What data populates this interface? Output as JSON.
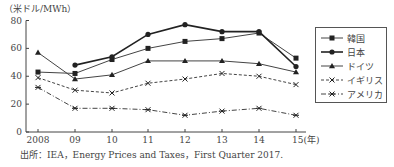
{
  "chart_data": {
    "type": "line",
    "title": "",
    "ylabel": "（米ドル/MWh）",
    "xlabel": "",
    "x": [
      "2008",
      "09",
      "10",
      "11",
      "12",
      "13",
      "14",
      "15(年)"
    ],
    "ylim": [
      0,
      80
    ],
    "yticks": [
      0,
      20,
      40,
      60,
      80
    ],
    "grid": false,
    "legend_position": "right",
    "series": [
      {
        "name": "韓国",
        "marker": "square",
        "line": "solid",
        "values": [
          43,
          42,
          52,
          60,
          65,
          67,
          71,
          53
        ]
      },
      {
        "name": "日本",
        "marker": "circle",
        "line": "solid-bold",
        "values": [
          null,
          48,
          54,
          70,
          77,
          72,
          72,
          47
        ]
      },
      {
        "name": "ドイツ",
        "marker": "triangle",
        "line": "solid",
        "values": [
          57,
          38,
          41,
          51,
          51,
          51,
          49,
          43
        ]
      },
      {
        "name": "イギリス",
        "marker": "x",
        "line": "dashed",
        "values": [
          39,
          30,
          28,
          35,
          38,
          42,
          40,
          34
        ]
      },
      {
        "name": "アメリカ",
        "marker": "asterisk",
        "line": "dash-dot",
        "values": [
          32,
          17,
          17,
          16,
          12,
          15,
          17,
          12
        ]
      }
    ],
    "source": "出所：IEA, Energy Prices and Taxes, First Quarter 2017."
  },
  "labels": {
    "unit": "（米ドル/MWh）",
    "source": "出所：IEA，Energy Prices and Taxes，First Quarter 2017."
  }
}
